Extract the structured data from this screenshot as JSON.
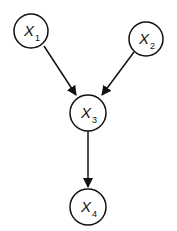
{
  "diagram": {
    "type": "directed-graph",
    "nodes": [
      {
        "id": "X1",
        "label": "X",
        "subscript": "1"
      },
      {
        "id": "X2",
        "label": "X",
        "subscript": "2"
      },
      {
        "id": "X3",
        "label": "X",
        "subscript": "3"
      },
      {
        "id": "X4",
        "label": "X",
        "subscript": "4"
      }
    ],
    "edges": [
      {
        "from": "X1",
        "to": "X3"
      },
      {
        "from": "X2",
        "to": "X3"
      },
      {
        "from": "X3",
        "to": "X4"
      }
    ],
    "colors": {
      "stroke": "#111111",
      "fill": "#ffffff"
    }
  }
}
